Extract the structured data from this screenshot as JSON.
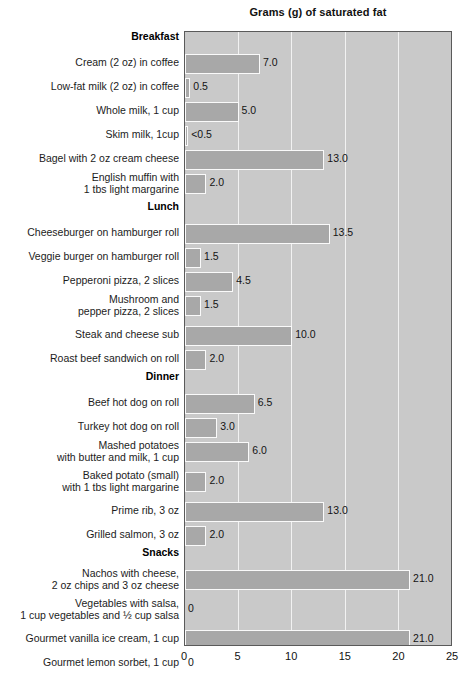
{
  "chart_data": {
    "type": "bar",
    "orientation": "horizontal",
    "title": "Grams (g) of saturated fat",
    "xlabel": "",
    "ylabel": "",
    "xlim": [
      0,
      25
    ],
    "xticks": [
      0,
      5,
      10,
      15,
      20,
      25
    ],
    "xtick_labels": [
      "0",
      "5",
      "10",
      "15",
      "20",
      "25"
    ],
    "grid": "vertical",
    "legend": "none",
    "colors": {
      "bar_fill": "#a8a8a8",
      "bar_border": "#fafafa",
      "plot_background": "#c9c9c9",
      "plot_border": "#5a5a5a",
      "gridline": "#f2f2f2",
      "text": "#1a1a1a",
      "page_background": "#ffffff"
    },
    "sections": [
      {
        "name": "Breakfast",
        "items": [
          {
            "label": "Cream (2 oz) in coffee",
            "value": 7.0,
            "value_label": "7.0"
          },
          {
            "label": "Low-fat milk (2 oz) in coffee",
            "value": 0.5,
            "value_label": "0.5"
          },
          {
            "label": "Whole milk, 1 cup",
            "value": 5.0,
            "value_label": "5.0"
          },
          {
            "label": "Skim milk, 1cup",
            "value": 0.3,
            "value_label": "<0.5"
          },
          {
            "label": "Bagel with 2 oz cream cheese",
            "value": 13.0,
            "value_label": "13.0"
          },
          {
            "label": "English muffin with\n1 tbs light margarine",
            "value": 2.0,
            "value_label": "2.0"
          }
        ]
      },
      {
        "name": "Lunch",
        "items": [
          {
            "label": "Cheeseburger on hamburger roll",
            "value": 13.5,
            "value_label": "13.5"
          },
          {
            "label": "Veggie burger on hamburger roll",
            "value": 1.5,
            "value_label": "1.5"
          },
          {
            "label": "Pepperoni pizza, 2 slices",
            "value": 4.5,
            "value_label": "4.5"
          },
          {
            "label": "Mushroom and\npepper pizza, 2 slices",
            "value": 1.5,
            "value_label": "1.5"
          },
          {
            "label": "Steak and cheese sub",
            "value": 10.0,
            "value_label": "10.0"
          },
          {
            "label": "Roast beef sandwich on roll",
            "value": 2.0,
            "value_label": "2.0"
          }
        ]
      },
      {
        "name": "Dinner",
        "items": [
          {
            "label": "Beef hot dog on roll",
            "value": 6.5,
            "value_label": "6.5"
          },
          {
            "label": "Turkey hot dog on roll",
            "value": 3.0,
            "value_label": "3.0"
          },
          {
            "label": "Mashed potatoes\nwith butter and milk, 1 cup",
            "value": 6.0,
            "value_label": "6.0"
          },
          {
            "label": "Baked potato (small)\nwith 1 tbs light margarine",
            "value": 2.0,
            "value_label": "2.0"
          },
          {
            "label": "Prime rib, 3 oz",
            "value": 13.0,
            "value_label": "13.0"
          },
          {
            "label": "Grilled salmon, 3 oz",
            "value": 2.0,
            "value_label": "2.0"
          }
        ]
      },
      {
        "name": "Snacks",
        "items": [
          {
            "label": "Nachos with cheese,\n2 oz chips and 3 oz cheese",
            "value": 21.0,
            "value_label": "21.0"
          },
          {
            "label": "Vegetables with salsa,\n1 cup vegetables and ½ cup salsa",
            "value": 0,
            "value_label": "0"
          },
          {
            "label": "Gourmet vanilla ice cream, 1 cup",
            "value": 21.0,
            "value_label": "21.0"
          },
          {
            "label": "Gourmet lemon sorbet, 1 cup",
            "value": 0,
            "value_label": "0"
          }
        ]
      }
    ]
  }
}
